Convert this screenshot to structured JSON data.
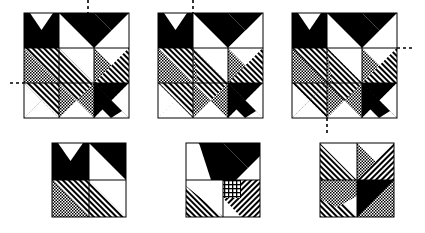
{
  "figure": {
    "width": 425,
    "height": 233,
    "background_color": "#ffffff"
  },
  "colors": {
    "solid_dark": "#000000",
    "light": "#ffffff",
    "outline": "#000000",
    "dash_line": "#000000",
    "dot_fill": "#b9b9b9",
    "hatch_fill": "#7d7d7d"
  },
  "fills": {
    "black": "solid black",
    "white": "plain white",
    "dots": "stippled / dotted grey",
    "hatch": "diagonal line hatching"
  },
  "top_row": {
    "count": 3,
    "grid": "3x3",
    "blocks": [
      {
        "id": "block-1",
        "label": "top-left block",
        "x": 24,
        "y": 13,
        "size": 105,
        "axes": [
          {
            "orientation": "vertical",
            "position_pct": 61,
            "extends": "above"
          },
          {
            "orientation": "horizontal",
            "position_pct": 56,
            "extends": "left"
          }
        ]
      },
      {
        "id": "block-2",
        "label": "top-middle block",
        "x": 158,
        "y": 13,
        "size": 105,
        "axes": [
          {
            "orientation": "vertical",
            "position_pct": 33,
            "extends": "above"
          }
        ]
      },
      {
        "id": "block-3",
        "label": "top-right block",
        "x": 292,
        "y": 13,
        "size": 105,
        "axes": [
          {
            "orientation": "horizontal",
            "position_pct": 33,
            "extends": "right"
          },
          {
            "orientation": "vertical",
            "position_pct": 33,
            "extends": "below"
          }
        ]
      }
    ],
    "cells": [
      [
        "notch-black",
        "diag-black-ul",
        "diag-black-ur"
      ],
      [
        "hatch-diag-a",
        "hatch-diag-b",
        "hatch-diag-c"
      ],
      [
        "hatch-bowtie-l",
        "dots-bowtie-c",
        "black-arrow-r"
      ]
    ]
  },
  "bottom_row": {
    "count": 3,
    "grid": "2x2",
    "blocks": [
      {
        "id": "block-4",
        "label": "bottom-left block",
        "x": 52,
        "y": 143,
        "size": 74,
        "cells": [
          [
            "notch-black",
            "diag-black-ur"
          ],
          [
            "hatch-diag-a",
            "hatch-diag-b"
          ]
        ]
      },
      {
        "id": "block-5",
        "label": "bottom-middle block",
        "x": 186,
        "y": 143,
        "size": 74,
        "cells": [
          [
            "diag-black-band-l",
            "diag-black-band-r"
          ],
          [
            "hatch-triangle",
            "dots-hatch-mix"
          ]
        ]
      },
      {
        "id": "block-6",
        "label": "bottom-right block",
        "x": 320,
        "y": 143,
        "size": 74,
        "cells": [
          [
            "hatch-pinwheel-ul",
            "hatch-pinwheel-ur"
          ],
          [
            "hatch-pinwheel-ll",
            "black-pinwheel-lr"
          ]
        ]
      }
    ]
  }
}
